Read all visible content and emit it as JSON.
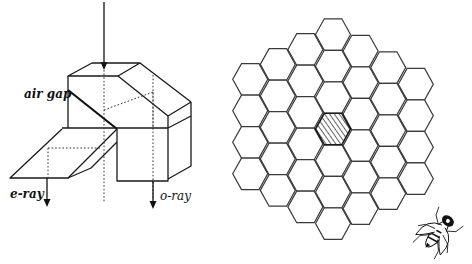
{
  "figure": {
    "left_panel": {
      "title": "birefringent prism (polarization analyzer)",
      "labels": {
        "air_gap": "air gap",
        "e_ray": "e-ray",
        "o_ray": "o-ray"
      }
    },
    "right_panel": {
      "title": "hexagonal ommatidia array",
      "grid": {
        "layout": "hexagon of hexagons",
        "column_counts": [
          4,
          5,
          6,
          7,
          6,
          5,
          4
        ],
        "total_cells": 37,
        "highlighted_cell": "center",
        "highlight_pattern": "diagonal-hatch"
      },
      "insect_icon": "fly-icon"
    }
  }
}
